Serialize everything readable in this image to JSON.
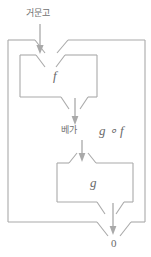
{
  "diagram": {
    "type": "function-composition-block-diagram",
    "stroke_color": "#a9a9a9",
    "label_color": "#6e6e6e",
    "background_color": "#ffffff",
    "labels": {
      "input": "거문고",
      "intermediate": "베가",
      "composition": "g ∘ f",
      "inner_box_first": "f",
      "inner_box_second": "g",
      "output": "0"
    },
    "boxes": [
      {
        "name": "outer-composition-box",
        "label": "g ∘ f"
      },
      {
        "name": "inner-box-f",
        "label": "f"
      },
      {
        "name": "inner-box-g",
        "label": "g"
      }
    ],
    "arrows": [
      {
        "name": "input-arrow",
        "label": "거문고",
        "direction": "down"
      },
      {
        "name": "intermediate-arrow",
        "label": "베가",
        "direction": "down"
      },
      {
        "name": "output-arrow",
        "label": "0",
        "direction": "down"
      }
    ]
  }
}
